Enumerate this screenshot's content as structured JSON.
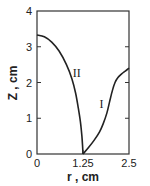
{
  "chart_data": {
    "type": "line",
    "title": "",
    "xlabel": "r , cm",
    "ylabel": "Z , cm",
    "xlim": [
      0,
      2.5
    ],
    "ylim": [
      0,
      4
    ],
    "x_ticks": [
      0,
      1.25,
      2.5
    ],
    "x_tick_labels": [
      "0",
      "1.25",
      "2.5"
    ],
    "y_ticks": [
      0,
      1,
      2,
      3,
      4
    ],
    "y_tick_labels": [
      "0",
      "1",
      "2",
      "3",
      "4"
    ],
    "grid": false,
    "legend": "none",
    "series": [
      {
        "name": "I",
        "x": [
          1.25,
          1.4,
          1.55,
          1.7,
          1.8,
          1.9,
          1.97,
          2.05,
          2.12,
          2.2,
          2.3,
          2.4,
          2.5
        ],
        "y": [
          0.0,
          0.18,
          0.38,
          0.62,
          0.85,
          1.15,
          1.45,
          1.78,
          2.0,
          2.14,
          2.24,
          2.32,
          2.4
        ]
      },
      {
        "name": "II",
        "x": [
          0.0,
          0.2,
          0.4,
          0.6,
          0.8,
          0.95,
          1.05,
          1.12,
          1.18,
          1.22,
          1.24,
          1.25
        ],
        "y": [
          3.33,
          3.28,
          3.13,
          2.88,
          2.5,
          2.1,
          1.7,
          1.3,
          0.9,
          0.5,
          0.2,
          0.0
        ]
      }
    ],
    "annotations": [
      {
        "text": "I",
        "x": 1.75,
        "y": 1.3
      },
      {
        "text": "II",
        "x": 1.08,
        "y": 2.15
      }
    ]
  }
}
